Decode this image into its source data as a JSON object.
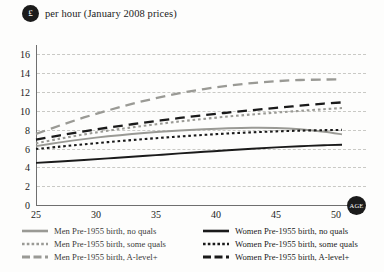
{
  "header": {
    "currency_badge": "£",
    "title": "per hour (January 2008 prices)"
  },
  "axis": {
    "x_badge": "AGE"
  },
  "chart_data": {
    "type": "line",
    "title": "per hour (January 2008 prices)",
    "xlabel": "AGE",
    "ylabel": "£ per hour (January 2008 prices)",
    "xlim": [
      25,
      52.5
    ],
    "ylim": [
      0,
      17
    ],
    "xticks": [
      25,
      30,
      35,
      40,
      45,
      50
    ],
    "yticks": [
      0,
      2,
      4,
      6,
      8,
      10,
      12,
      14,
      16
    ],
    "grid": true,
    "legend_position": "below",
    "x": [
      25,
      27,
      29,
      31,
      33,
      35,
      37,
      39,
      41,
      43,
      45,
      47,
      49,
      50.5
    ],
    "series": [
      {
        "name": "Men Pre-1955 birth, no quals",
        "color": "#9a9a95",
        "style": "solid",
        "values": [
          6.25,
          6.65,
          7.0,
          7.3,
          7.55,
          7.75,
          7.92,
          8.05,
          8.15,
          8.2,
          8.18,
          8.05,
          7.78,
          7.5
        ]
      },
      {
        "name": "Men Pre-1955 birth, some quals",
        "color": "#9a9a95",
        "style": "dotted",
        "values": [
          6.55,
          7.05,
          7.5,
          7.9,
          8.25,
          8.58,
          8.88,
          9.15,
          9.4,
          9.62,
          9.82,
          10.0,
          10.18,
          10.3
        ]
      },
      {
        "name": "Men Pre-1955 birth, A-level+",
        "color": "#9a9a95",
        "style": "dashed",
        "values": [
          7.55,
          8.45,
          9.3,
          10.05,
          10.75,
          11.35,
          11.88,
          12.32,
          12.68,
          12.95,
          13.15,
          13.28,
          13.33,
          13.35
        ]
      },
      {
        "name": "Women Pre-1955 birth, no quals",
        "color": "#1a1a1a",
        "style": "solid",
        "values": [
          4.48,
          4.62,
          4.78,
          4.95,
          5.12,
          5.3,
          5.48,
          5.65,
          5.82,
          5.98,
          6.12,
          6.25,
          6.35,
          6.4
        ]
      },
      {
        "name": "Women Pre-1955 birth, some quals",
        "color": "#1a1a1a",
        "style": "dotted",
        "values": [
          5.95,
          6.2,
          6.45,
          6.68,
          6.9,
          7.1,
          7.28,
          7.45,
          7.6,
          7.72,
          7.82,
          7.9,
          7.95,
          7.98
        ]
      },
      {
        "name": "Women Pre-1955 birth, A-level+",
        "color": "#1a1a1a",
        "style": "dashed",
        "values": [
          6.95,
          7.4,
          7.82,
          8.22,
          8.58,
          8.92,
          9.25,
          9.55,
          9.82,
          10.08,
          10.32,
          10.55,
          10.78,
          10.9
        ]
      }
    ]
  },
  "legend": {
    "left_column": [
      {
        "label": "Men Pre-1955 birth, no quals",
        "color": "#9a9a95",
        "style": "solid"
      },
      {
        "label": "Men Pre-1955 birth, some quals",
        "color": "#9a9a95",
        "style": "dotted"
      },
      {
        "label": "Men Pre-1955 birth, A-level+",
        "color": "#9a9a95",
        "style": "dashed"
      }
    ],
    "right_column": [
      {
        "label": "Women Pre-1955 birth, no quals",
        "color": "#1a1a1a",
        "style": "solid"
      },
      {
        "label": "Women Pre-1955 birth, some quals",
        "color": "#1a1a1a",
        "style": "dotted"
      },
      {
        "label": "Women Pre-1955 birth, A-level+",
        "color": "#1a1a1a",
        "style": "dashed"
      }
    ]
  }
}
